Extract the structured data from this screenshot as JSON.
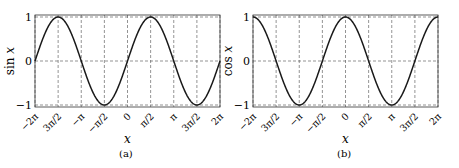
{
  "chart_data": [
    {
      "type": "line",
      "panel": "(a)",
      "function": "sin",
      "xlabel": "x",
      "ylabel": "sin x",
      "xlim": [
        -6.2832,
        6.2832
      ],
      "ylim": [
        -1,
        1
      ],
      "grid": true,
      "grid_style": "dashed",
      "xticks": [
        -6.2832,
        -4.7124,
        -3.1416,
        -1.5708,
        0,
        1.5708,
        3.1416,
        4.7124,
        6.2832
      ],
      "xtick_labels": [
        "−2π",
        "3π/2",
        "−π",
        "−π/2",
        "0",
        "π/2",
        "π",
        "3π/2",
        "2π"
      ],
      "yticks": [
        -1,
        0,
        1
      ],
      "ytick_labels": [
        "−1",
        "0",
        "1"
      ],
      "series": [
        {
          "name": "sin x",
          "x": [
            -6.2832,
            -4.7124,
            -3.1416,
            -1.5708,
            0,
            1.5708,
            3.1416,
            4.7124,
            6.2832
          ],
          "y": [
            0,
            1,
            0,
            -1,
            0,
            1,
            0,
            -1,
            0
          ]
        }
      ],
      "caption": "(a)"
    },
    {
      "type": "line",
      "panel": "(b)",
      "function": "cos",
      "xlabel": "x",
      "ylabel": "cos x",
      "xlim": [
        -6.2832,
        6.2832
      ],
      "ylim": [
        -1,
        1
      ],
      "grid": true,
      "grid_style": "dashed",
      "xticks": [
        -6.2832,
        -4.7124,
        -3.1416,
        -1.5708,
        0,
        1.5708,
        3.1416,
        4.7124,
        6.2832
      ],
      "xtick_labels": [
        "−2π",
        "3π/2",
        "−π",
        "−π/2",
        "0",
        "π/2",
        "π",
        "3π/2",
        "2π"
      ],
      "yticks": [
        -1,
        0,
        1
      ],
      "ytick_labels": [
        "−1",
        "0",
        "1"
      ],
      "series": [
        {
          "name": "cos x",
          "x": [
            -6.2832,
            -4.7124,
            -3.1416,
            -1.5708,
            0,
            1.5708,
            3.1416,
            4.7124,
            6.2832
          ],
          "y": [
            1,
            0,
            -1,
            0,
            1,
            0,
            -1,
            0,
            1
          ]
        }
      ],
      "caption": "(b)"
    }
  ],
  "panels": [
    {
      "box": {
        "left": 35,
        "top": 15,
        "right": 220,
        "bottom": 107
      },
      "ylabel_x": 14,
      "caption_x": 127
    },
    {
      "box": {
        "left": 253,
        "top": 15,
        "right": 438,
        "bottom": 107
      },
      "ylabel_x": 232,
      "caption_x": 345
    }
  ],
  "colors": {
    "curve": "#1a1a1a",
    "grid": "#666666",
    "axis": "#333333"
  }
}
